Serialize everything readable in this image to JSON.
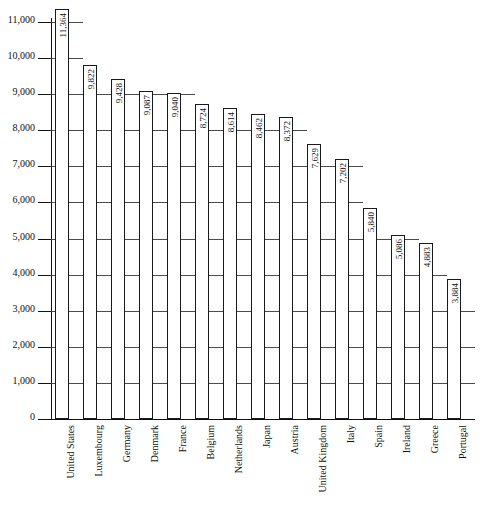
{
  "chart_data": {
    "type": "bar",
    "title": "",
    "subtitle": "",
    "xlabel": "",
    "ylabel": "",
    "ylim": [
      0,
      11000
    ],
    "ytick_interval": 1000,
    "grid": true,
    "legend": null,
    "orientation": "vertical",
    "bar_fill": "#ffffff",
    "bar_stroke": "#1a1a1a",
    "value_labels_rotated": true,
    "category_labels_rotated": true,
    "ytick_labels": [
      "0",
      "1,000",
      "2,000",
      "3,000",
      "4,000",
      "5,000",
      "6,000",
      "7,000",
      "8,000",
      "9,000",
      "10,000",
      "11,000"
    ],
    "ytick_values": [
      0,
      1000,
      2000,
      3000,
      4000,
      5000,
      6000,
      7000,
      8000,
      9000,
      10000,
      11000
    ],
    "categories": [
      "United States",
      "Luxembourg",
      "Germany",
      "Denmark",
      "France",
      "Belgium",
      "Netherlands",
      "Japan",
      "Austria",
      "United Kingdom",
      "Italy",
      "Spain",
      "Ireland",
      "Greece",
      "Portugal"
    ],
    "values": [
      11364,
      9822,
      9428,
      9087,
      9040,
      8724,
      8614,
      8462,
      8372,
      7629,
      7202,
      5840,
      5086,
      4883,
      3884
    ],
    "value_labels": [
      "11,364",
      "9,822",
      "9,428",
      "9,087",
      "9,040",
      "8,724",
      "8,614",
      "8,462",
      "8,372",
      "7,629",
      "7,202",
      "5,840",
      "5,086",
      "4,883",
      "3,884"
    ],
    "bars": [
      {
        "category": "United States",
        "value": 11364,
        "label": "11,364"
      },
      {
        "category": "Luxembourg",
        "value": 9822,
        "label": "9,822"
      },
      {
        "category": "Germany",
        "value": 9428,
        "label": "9,428"
      },
      {
        "category": "Denmark",
        "value": 9087,
        "label": "9,087"
      },
      {
        "category": "France",
        "value": 9040,
        "label": "9,040"
      },
      {
        "category": "Belgium",
        "value": 8724,
        "label": "8,724"
      },
      {
        "category": "Netherlands",
        "value": 8614,
        "label": "8,614"
      },
      {
        "category": "Japan",
        "value": 8462,
        "label": "8,462"
      },
      {
        "category": "Austria",
        "value": 8372,
        "label": "8,372"
      },
      {
        "category": "United Kingdom",
        "value": 7629,
        "label": "7,629"
      },
      {
        "category": "Italy",
        "value": 7202,
        "label": "7,202"
      },
      {
        "category": "Spain",
        "value": 5840,
        "label": "5,840"
      },
      {
        "category": "Ireland",
        "value": 5086,
        "label": "5,086"
      },
      {
        "category": "Greece",
        "value": 4883,
        "label": "4,883"
      },
      {
        "category": "Portugal",
        "value": 3884,
        "label": "3,884"
      }
    ]
  }
}
